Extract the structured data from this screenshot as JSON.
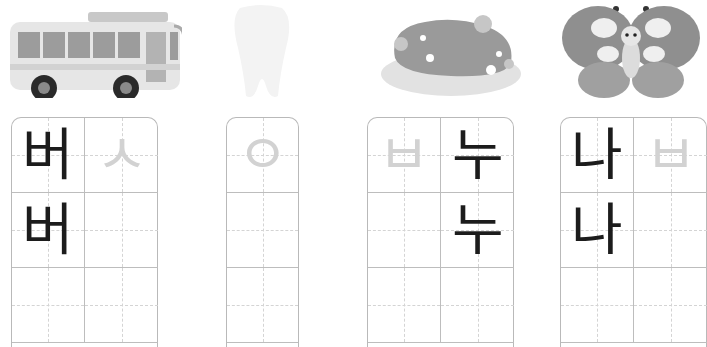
{
  "worksheet": {
    "words": [
      {
        "picture": "bus-icon",
        "columns": 2,
        "rows": [
          [
            {
              "char": "버",
              "style": "solid"
            },
            {
              "char": "ㅅ",
              "style": "trace"
            }
          ],
          [
            {
              "char": "버",
              "style": "solid"
            },
            {
              "char": "",
              "style": "empty"
            }
          ],
          [
            {
              "char": "",
              "style": "empty"
            },
            {
              "char": "",
              "style": "empty"
            }
          ]
        ]
      },
      {
        "picture": "tooth-icon",
        "columns": 1,
        "rows": [
          [
            {
              "char": "ㅇ",
              "style": "trace"
            }
          ],
          [
            {
              "char": "",
              "style": "empty"
            }
          ],
          [
            {
              "char": "",
              "style": "empty"
            }
          ]
        ]
      },
      {
        "picture": "island-icon",
        "columns": 2,
        "rows": [
          [
            {
              "char": "ㅂ",
              "style": "trace"
            },
            {
              "char": "누",
              "style": "solid"
            }
          ],
          [
            {
              "char": "",
              "style": "empty"
            },
            {
              "char": "누",
              "style": "solid"
            }
          ],
          [
            {
              "char": "",
              "style": "empty"
            },
            {
              "char": "",
              "style": "empty"
            }
          ]
        ]
      },
      {
        "picture": "butterfly-icon",
        "columns": 2,
        "rows": [
          [
            {
              "char": "나",
              "style": "solid"
            },
            {
              "char": "ㅂ",
              "style": "trace"
            }
          ],
          [
            {
              "char": "나",
              "style": "solid"
            },
            {
              "char": "",
              "style": "empty"
            }
          ],
          [
            {
              "char": "",
              "style": "empty"
            },
            {
              "char": "",
              "style": "empty"
            }
          ]
        ]
      }
    ]
  },
  "colors": {
    "grid_line": "#bdbdbd",
    "guide_line": "#d4d4d4",
    "solid_text": "#1c1c1c",
    "trace_text": "#d2d2d2"
  }
}
